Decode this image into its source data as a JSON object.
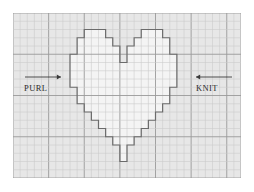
{
  "diagram": {
    "type": "knitting-stitch-chart",
    "title_visible": false,
    "grid": {
      "columns": 32,
      "rows": 20,
      "cell_width": 7.125,
      "cell_height": 8.25,
      "minor_line_color": "#c9c9c9",
      "major_line_color": "#9a9a9a",
      "major_every": 5,
      "background_color": "#efefef",
      "outside_fill": "#e8e8e8",
      "inside_fill": "#f4f4f4"
    },
    "shape": {
      "name": "heart",
      "outline_color": "#6b6b6b",
      "outline_width": 1.2,
      "fill": "#f4f4f4",
      "cells_path": "M 8,9 L 8,5 L 9,5 L 9,3 L 10,3 L 10,2 L 13,2 L 13,3 L 14,3 L 14,4 L 15,4 L 15,6 L 16,6 L 16,4 L 17,4 L 17,3 L 18,3 L 18,2 L 21,2 L 21,3 L 22,3 L 22,5 L 23,5 L 23,9 L 22,9 L 22,11 L 21,11 L 21,12 L 20,12 L 20,13 L 19,13 L 19,14 L 18,14 L 18,15 L 17,15 L 17,16 L 16,16 L 16,18 L 15,18 L 15,16 L 14,16 L 14,15 L 13,15 L 13,14 L 12,14 L 12,13 L 11,13 L 11,12 L 10,12 L 10,11 L 9,11 L 9,9 Z"
    },
    "annotations": [
      {
        "id": "purl",
        "label": "PURL",
        "arrow_direction": "right",
        "arrow_color": "#3a3a3a",
        "arrow_x_start": 12,
        "arrow_x_end": 48,
        "arrow_y": 64,
        "label_x": 11,
        "label_y": 71
      },
      {
        "id": "knit",
        "label": "KNIT",
        "arrow_direction": "left",
        "arrow_color": "#3a3a3a",
        "arrow_x_start": 219,
        "arrow_x_end": 183,
        "arrow_y": 64,
        "label_x": 183,
        "label_y": 71
      }
    ]
  }
}
